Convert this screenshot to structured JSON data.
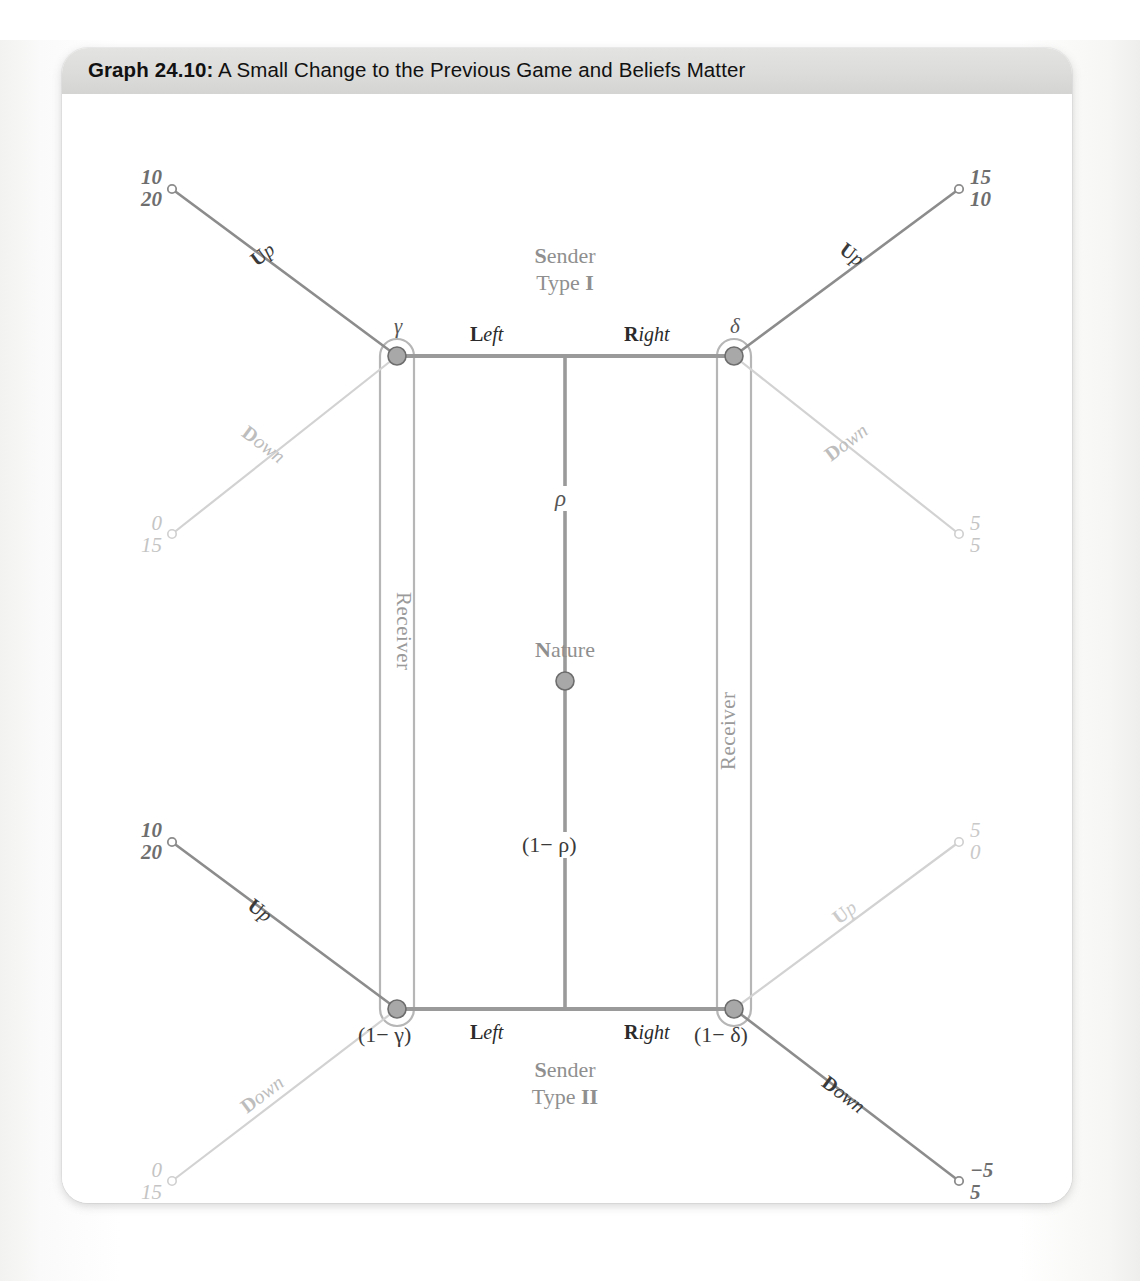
{
  "figure": {
    "label": "Graph 24.10:",
    "title": " A Small Change to the Previous Game and Beliefs Matter"
  },
  "players": {
    "sender_type_1_line1": "Sender",
    "sender_type_1_line2_a": "Type ",
    "sender_type_1_line2_b": "I",
    "sender_type_2_line1": "Sender",
    "sender_type_2_line2_a": "Type ",
    "sender_type_2_line2_b": "II",
    "nature_cap": "N",
    "nature_rest": "ature",
    "receiver_top": "Receiver",
    "receiver_bottom": "Receiver"
  },
  "nature_branches": {
    "up_prob": "ρ",
    "down_prob": "(1− ρ)"
  },
  "decision_nodes": {
    "top_left": "γ",
    "top_right": "δ",
    "bottom_left": "(1− γ)",
    "bottom_right": "(1− δ)"
  },
  "sender_actions": {
    "top_left": "Left",
    "top_right": "Right",
    "bottom_left": "Left",
    "bottom_right": "Right",
    "left_cap": "L",
    "left_rest": "eft",
    "right_cap": "R",
    "right_rest": "ight"
  },
  "receiver_actions": {
    "up_cap": "U",
    "up_rest": "p",
    "down_cap": "D",
    "down_rest": "own"
  },
  "terminal_nodes": [
    {
      "id": "tl-up",
      "action": "Up",
      "payoff_1": "10",
      "payoff_2": "20",
      "emphasis": "dark"
    },
    {
      "id": "tl-down",
      "action": "Down",
      "payoff_1": "0",
      "payoff_2": "15",
      "emphasis": "light"
    },
    {
      "id": "tr-up",
      "action": "Up",
      "payoff_1": "15",
      "payoff_2": "10",
      "emphasis": "dark"
    },
    {
      "id": "tr-down",
      "action": "Down",
      "payoff_1": "5",
      "payoff_2": "5",
      "emphasis": "light"
    },
    {
      "id": "bl-up",
      "action": "Up",
      "payoff_1": "10",
      "payoff_2": "20",
      "emphasis": "dark"
    },
    {
      "id": "bl-down",
      "action": "Down",
      "payoff_1": "0",
      "payoff_2": "15",
      "emphasis": "light"
    },
    {
      "id": "br-up",
      "action": "Up",
      "payoff_1": "5",
      "payoff_2": "0",
      "emphasis": "light"
    },
    {
      "id": "br-down",
      "action": "Down",
      "payoff_1": "−5",
      "payoff_2": "5",
      "emphasis": "dark"
    }
  ],
  "colors": {
    "header_band": "#dcdcda",
    "line_dark": "#8c8c8c",
    "line_light": "#c9c9c9",
    "node_fill": "#a8a8a8",
    "text_dark": "#2b2b2b",
    "text_light": "#bdbdbd",
    "text_gray": "#8f8f8f"
  }
}
